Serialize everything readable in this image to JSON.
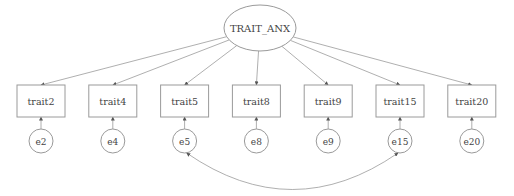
{
  "diagram": {
    "type": "sem-path-diagram",
    "colors": {
      "stroke": "#9a9a9a",
      "text": "#444444",
      "background": "#ffffff"
    },
    "latent": {
      "id": "TRAIT_ANX",
      "label": "TRAIT_ANX"
    },
    "indicators": [
      {
        "id": "trait2",
        "label": "trait2",
        "error": "e2"
      },
      {
        "id": "trait4",
        "label": "trait4",
        "error": "e4"
      },
      {
        "id": "trait5",
        "label": "trait5",
        "error": "e5"
      },
      {
        "id": "trait8",
        "label": "trait8",
        "error": "e8"
      },
      {
        "id": "trait9",
        "label": "trait9",
        "error": "e9"
      },
      {
        "id": "trait15",
        "label": "trait15",
        "error": "e15"
      },
      {
        "id": "trait20",
        "label": "trait20",
        "error": "e20"
      }
    ],
    "covariances": [
      {
        "from": "e5",
        "to": "e15"
      }
    ]
  }
}
